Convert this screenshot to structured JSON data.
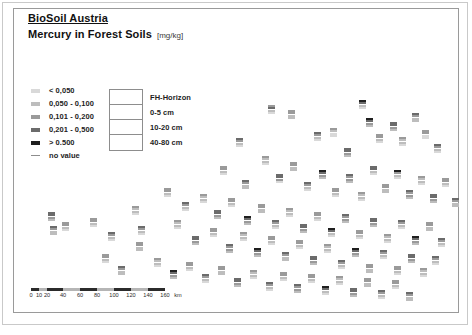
{
  "document": {
    "title": "BioSoil Austria",
    "subtitle": "Mercury in Forest Soils",
    "unit": "[mg/kg]"
  },
  "legend": {
    "classes": [
      {
        "label": "< 0,050",
        "color": "#d9d9d9"
      },
      {
        "label": "0,050 - 0,100",
        "color": "#bdbdbd"
      },
      {
        "label": "0,101 - 0,200",
        "color": "#9a9a9a"
      },
      {
        "label": "0,201 - 0,500",
        "color": "#6b6b6b"
      },
      {
        "label": "> 0.500",
        "color": "#1f1f1f"
      },
      {
        "label": "no value",
        "color": "#8d8d8d"
      }
    ],
    "horizon": {
      "rows": [
        "FH-Horizon",
        "0-5 cm",
        "10-20 cm",
        "40-80 cm"
      ]
    }
  },
  "scalebar": {
    "unit_label": "km",
    "ticks": [
      "0",
      "10",
      "20",
      "40",
      "60",
      "80",
      "100",
      "120",
      "140",
      "160"
    ],
    "tick_positions": [
      0,
      8,
      16,
      32,
      49,
      66,
      83,
      100,
      117,
      134
    ]
  },
  "chart_data": {
    "type": "scatter",
    "title": "Mercury in Forest Soils",
    "subtitle": "BioSoil Austria",
    "unit": "mg/kg",
    "xlabel": "",
    "ylabel": "",
    "grid": false,
    "legend_position": "top-left",
    "marker_description": "Each site is a 4-row stacked bar symbol; rows top-to-bottom = FH-Horizon, 0-5 cm, 10-20 cm, 40-80 cm. Row gray level encodes the mercury concentration class.",
    "class_breaks": [
      "< 0,050",
      "0,050 - 0,100",
      "0,101 - 0,200",
      "0,201 - 0,500",
      "> 0.500",
      "no value"
    ],
    "class_colors": [
      "#d9d9d9",
      "#bdbdbd",
      "#9a9a9a",
      "#6b6b6b",
      "#1f1f1f",
      "#8d8d8d"
    ],
    "points": [
      {
        "x": 254,
        "y": 35,
        "c": [
          2,
          3,
          1,
          0
        ]
      },
      {
        "x": 222,
        "y": 68,
        "c": [
          3,
          2,
          1,
          0
        ]
      },
      {
        "x": 274,
        "y": 40,
        "c": [
          2,
          2,
          1,
          1
        ]
      },
      {
        "x": 300,
        "y": 62,
        "c": [
          3,
          2,
          1,
          0
        ]
      },
      {
        "x": 316,
        "y": 58,
        "c": [
          2,
          1,
          0,
          0
        ]
      },
      {
        "x": 330,
        "y": 78,
        "c": [
          3,
          3,
          2,
          1
        ]
      },
      {
        "x": 345,
        "y": 30,
        "c": [
          4,
          3,
          1,
          0
        ]
      },
      {
        "x": 352,
        "y": 48,
        "c": [
          4,
          3,
          2,
          1
        ]
      },
      {
        "x": 362,
        "y": 64,
        "c": [
          2,
          2,
          1,
          0
        ]
      },
      {
        "x": 376,
        "y": 52,
        "c": [
          3,
          3,
          2,
          1
        ]
      },
      {
        "x": 385,
        "y": 67,
        "c": [
          2,
          1,
          1,
          0
        ]
      },
      {
        "x": 398,
        "y": 43,
        "c": [
          3,
          2,
          1,
          1
        ]
      },
      {
        "x": 408,
        "y": 60,
        "c": [
          2,
          2,
          0,
          0
        ]
      },
      {
        "x": 420,
        "y": 74,
        "c": [
          3,
          2,
          1,
          0
        ]
      },
      {
        "x": 206,
        "y": 96,
        "c": [
          2,
          2,
          1,
          0
        ]
      },
      {
        "x": 228,
        "y": 110,
        "c": [
          3,
          2,
          1,
          1
        ]
      },
      {
        "x": 248,
        "y": 86,
        "c": [
          2,
          1,
          1,
          0
        ]
      },
      {
        "x": 262,
        "y": 104,
        "c": [
          3,
          3,
          2,
          0
        ]
      },
      {
        "x": 276,
        "y": 92,
        "c": [
          2,
          2,
          1,
          1
        ]
      },
      {
        "x": 290,
        "y": 112,
        "c": [
          3,
          2,
          1,
          0
        ]
      },
      {
        "x": 305,
        "y": 100,
        "c": [
          4,
          3,
          2,
          1
        ]
      },
      {
        "x": 318,
        "y": 118,
        "c": [
          2,
          2,
          1,
          0
        ]
      },
      {
        "x": 332,
        "y": 104,
        "c": [
          3,
          2,
          2,
          1
        ]
      },
      {
        "x": 344,
        "y": 122,
        "c": [
          2,
          1,
          1,
          0
        ]
      },
      {
        "x": 356,
        "y": 96,
        "c": [
          3,
          3,
          1,
          0
        ]
      },
      {
        "x": 368,
        "y": 114,
        "c": [
          2,
          2,
          1,
          1
        ]
      },
      {
        "x": 380,
        "y": 100,
        "c": [
          4,
          2,
          1,
          0
        ]
      },
      {
        "x": 392,
        "y": 120,
        "c": [
          3,
          2,
          2,
          1
        ]
      },
      {
        "x": 404,
        "y": 106,
        "c": [
          2,
          1,
          1,
          0
        ]
      },
      {
        "x": 416,
        "y": 124,
        "c": [
          3,
          3,
          2,
          1
        ]
      },
      {
        "x": 428,
        "y": 108,
        "c": [
          2,
          2,
          1,
          0
        ]
      },
      {
        "x": 438,
        "y": 128,
        "c": [
          3,
          2,
          1,
          1
        ]
      },
      {
        "x": 150,
        "y": 118,
        "c": [
          2,
          2,
          1,
          0
        ]
      },
      {
        "x": 168,
        "y": 132,
        "c": [
          3,
          2,
          1,
          0
        ]
      },
      {
        "x": 186,
        "y": 124,
        "c": [
          2,
          1,
          1,
          0
        ]
      },
      {
        "x": 200,
        "y": 140,
        "c": [
          3,
          3,
          2,
          1
        ]
      },
      {
        "x": 214,
        "y": 128,
        "c": [
          2,
          2,
          1,
          0
        ]
      },
      {
        "x": 230,
        "y": 146,
        "c": [
          4,
          3,
          2,
          1
        ]
      },
      {
        "x": 244,
        "y": 134,
        "c": [
          2,
          2,
          1,
          1
        ]
      },
      {
        "x": 258,
        "y": 150,
        "c": [
          3,
          2,
          1,
          0
        ]
      },
      {
        "x": 272,
        "y": 138,
        "c": [
          2,
          1,
          1,
          0
        ]
      },
      {
        "x": 286,
        "y": 154,
        "c": [
          3,
          3,
          2,
          1
        ]
      },
      {
        "x": 300,
        "y": 142,
        "c": [
          2,
          2,
          1,
          0
        ]
      },
      {
        "x": 314,
        "y": 158,
        "c": [
          4,
          3,
          1,
          0
        ]
      },
      {
        "x": 328,
        "y": 144,
        "c": [
          3,
          2,
          2,
          1
        ]
      },
      {
        "x": 342,
        "y": 160,
        "c": [
          2,
          2,
          1,
          0
        ]
      },
      {
        "x": 356,
        "y": 148,
        "c": [
          3,
          3,
          2,
          1
        ]
      },
      {
        "x": 370,
        "y": 164,
        "c": [
          2,
          1,
          1,
          0
        ]
      },
      {
        "x": 384,
        "y": 150,
        "c": [
          3,
          2,
          1,
          0
        ]
      },
      {
        "x": 398,
        "y": 166,
        "c": [
          4,
          3,
          2,
          1
        ]
      },
      {
        "x": 412,
        "y": 152,
        "c": [
          2,
          2,
          1,
          1
        ]
      },
      {
        "x": 424,
        "y": 168,
        "c": [
          3,
          2,
          1,
          0
        ]
      },
      {
        "x": 34,
        "y": 142,
        "c": [
          3,
          3,
          2,
          1
        ]
      },
      {
        "x": 48,
        "y": 152,
        "c": [
          2,
          2,
          1,
          0
        ]
      },
      {
        "x": 36,
        "y": 156,
        "c": [
          3,
          2,
          1,
          1
        ]
      },
      {
        "x": 76,
        "y": 148,
        "c": [
          2,
          2,
          1,
          0
        ]
      },
      {
        "x": 118,
        "y": 136,
        "c": [
          2,
          1,
          1,
          0
        ]
      },
      {
        "x": 124,
        "y": 156,
        "c": [
          3,
          2,
          1,
          0
        ]
      },
      {
        "x": 122,
        "y": 172,
        "c": [
          2,
          2,
          1,
          1
        ]
      },
      {
        "x": 94,
        "y": 162,
        "c": [
          3,
          2,
          1,
          0
        ]
      },
      {
        "x": 160,
        "y": 150,
        "c": [
          2,
          1,
          1,
          0
        ]
      },
      {
        "x": 178,
        "y": 166,
        "c": [
          3,
          3,
          2,
          1
        ]
      },
      {
        "x": 196,
        "y": 158,
        "c": [
          2,
          2,
          1,
          0
        ]
      },
      {
        "x": 212,
        "y": 174,
        "c": [
          3,
          2,
          2,
          1
        ]
      },
      {
        "x": 226,
        "y": 162,
        "c": [
          2,
          1,
          1,
          0
        ]
      },
      {
        "x": 240,
        "y": 178,
        "c": [
          4,
          3,
          2,
          1
        ]
      },
      {
        "x": 254,
        "y": 166,
        "c": [
          2,
          2,
          1,
          0
        ]
      },
      {
        "x": 268,
        "y": 182,
        "c": [
          3,
          2,
          1,
          1
        ]
      },
      {
        "x": 282,
        "y": 170,
        "c": [
          2,
          2,
          1,
          0
        ]
      },
      {
        "x": 296,
        "y": 186,
        "c": [
          3,
          3,
          2,
          1
        ]
      },
      {
        "x": 310,
        "y": 174,
        "c": [
          2,
          1,
          1,
          0
        ]
      },
      {
        "x": 324,
        "y": 190,
        "c": [
          3,
          2,
          1,
          0
        ]
      },
      {
        "x": 338,
        "y": 178,
        "c": [
          4,
          3,
          2,
          1
        ]
      },
      {
        "x": 352,
        "y": 194,
        "c": [
          2,
          2,
          1,
          1
        ]
      },
      {
        "x": 366,
        "y": 180,
        "c": [
          3,
          2,
          1,
          0
        ]
      },
      {
        "x": 380,
        "y": 196,
        "c": [
          2,
          2,
          1,
          0
        ]
      },
      {
        "x": 394,
        "y": 184,
        "c": [
          3,
          3,
          2,
          1
        ]
      },
      {
        "x": 406,
        "y": 198,
        "c": [
          2,
          1,
          1,
          0
        ]
      },
      {
        "x": 418,
        "y": 186,
        "c": [
          3,
          2,
          1,
          0
        ]
      },
      {
        "x": 88,
        "y": 184,
        "c": [
          2,
          2,
          1,
          0
        ]
      },
      {
        "x": 104,
        "y": 196,
        "c": [
          3,
          2,
          1,
          1
        ]
      },
      {
        "x": 140,
        "y": 188,
        "c": [
          2,
          1,
          1,
          0
        ]
      },
      {
        "x": 156,
        "y": 200,
        "c": [
          4,
          3,
          2,
          1
        ]
      },
      {
        "x": 172,
        "y": 192,
        "c": [
          2,
          2,
          1,
          0
        ]
      },
      {
        "x": 188,
        "y": 204,
        "c": [
          3,
          2,
          1,
          0
        ]
      },
      {
        "x": 204,
        "y": 196,
        "c": [
          2,
          2,
          1,
          1
        ]
      },
      {
        "x": 220,
        "y": 208,
        "c": [
          3,
          3,
          2,
          1
        ]
      },
      {
        "x": 236,
        "y": 200,
        "c": [
          2,
          1,
          1,
          0
        ]
      },
      {
        "x": 252,
        "y": 212,
        "c": [
          3,
          2,
          1,
          0
        ]
      },
      {
        "x": 266,
        "y": 202,
        "c": [
          2,
          2,
          1,
          0
        ]
      },
      {
        "x": 280,
        "y": 214,
        "c": [
          3,
          2,
          2,
          1
        ]
      },
      {
        "x": 294,
        "y": 204,
        "c": [
          2,
          2,
          1,
          0
        ]
      },
      {
        "x": 308,
        "y": 216,
        "c": [
          4,
          3,
          1,
          0
        ]
      },
      {
        "x": 322,
        "y": 206,
        "c": [
          2,
          1,
          1,
          0
        ]
      },
      {
        "x": 336,
        "y": 218,
        "c": [
          3,
          3,
          2,
          1
        ]
      },
      {
        "x": 350,
        "y": 208,
        "c": [
          2,
          2,
          1,
          1
        ]
      },
      {
        "x": 364,
        "y": 220,
        "c": [
          3,
          2,
          1,
          0
        ]
      },
      {
        "x": 378,
        "y": 210,
        "c": [
          2,
          2,
          1,
          0
        ]
      },
      {
        "x": 392,
        "y": 222,
        "c": [
          3,
          2,
          1,
          1
        ]
      }
    ]
  }
}
